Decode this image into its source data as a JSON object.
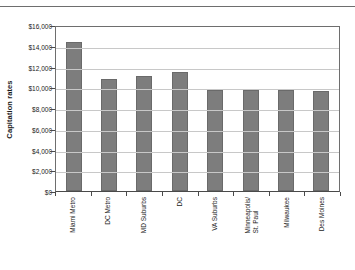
{
  "chart_data": {
    "type": "bar",
    "title": "",
    "subtitle": "",
    "xlabel": "",
    "ylabel": "Capitation rates",
    "ylim": [
      0,
      16000
    ],
    "grid": true,
    "legend": "none",
    "orientation": "vertical",
    "bar_color": "#7d7d7d",
    "categories": [
      "Miami Metro",
      "DC Metro",
      "MD Suburbs",
      "DC",
      "VA Suburbs",
      "Minneapolis/ St. Paul",
      "Milwaukee",
      "Des Moines"
    ],
    "category_lines": [
      [
        "Miami Metro"
      ],
      [
        "DC Metro"
      ],
      [
        "MD Suburbs"
      ],
      [
        "DC"
      ],
      [
        "VA Suburbs"
      ],
      [
        "Minneapolis/",
        "St. Paul"
      ],
      [
        "Milwaukee"
      ],
      [
        "Des Moines"
      ]
    ],
    "values": [
      14400,
      10750,
      11100,
      11500,
      9700,
      9700,
      9700,
      9650
    ],
    "y_ticks": [
      0,
      2000,
      4000,
      6000,
      8000,
      10000,
      12000,
      14000,
      16000
    ],
    "y_tick_labels": [
      "$0",
      "$2,000",
      "$4,000",
      "$6,000",
      "$8,000",
      "$10,000",
      "$12,000",
      "$14,000",
      "$16,000"
    ]
  }
}
